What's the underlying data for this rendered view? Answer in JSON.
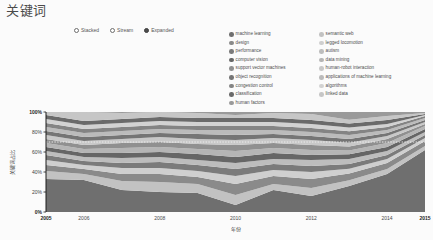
{
  "header": {
    "title": "关键词"
  },
  "layout_mode": {
    "name": "layout-mode",
    "selected": "Expanded",
    "options": [
      {
        "label": "Stacked",
        "selected": false
      },
      {
        "label": "Stream",
        "selected": false
      },
      {
        "label": "Expanded",
        "selected": true
      }
    ]
  },
  "legend": {
    "columns": 2,
    "items": [
      {
        "label": "machine learning",
        "color": "#6f6f6f"
      },
      {
        "label": "semantic web",
        "color": "#c2c2c2"
      },
      {
        "label": "design",
        "color": "#8a8a8a"
      },
      {
        "label": "legged locomotion",
        "color": "#cfcfcf"
      },
      {
        "label": "performance",
        "color": "#7b7b7b"
      },
      {
        "label": "autism",
        "color": "#bdbdbd"
      },
      {
        "label": "computer vision",
        "color": "#666666"
      },
      {
        "label": "data mining",
        "color": "#b5b5b5"
      },
      {
        "label": "support vector machines",
        "color": "#909090"
      },
      {
        "label": "human-robot interaction",
        "color": "#c8c8c8"
      },
      {
        "label": "object recognition",
        "color": "#757575"
      },
      {
        "label": "applications of machine learning",
        "color": "#bbbbbb"
      },
      {
        "label": "congestion control",
        "color": "#848484"
      },
      {
        "label": "algorithms",
        "color": "#d2d2d2"
      },
      {
        "label": "classification",
        "color": "#6a6a6a"
      },
      {
        "label": "linked data",
        "color": "#c6c6c6"
      },
      {
        "label": "human factors",
        "color": "#9a9a9a"
      }
    ]
  },
  "chart_data": {
    "type": "area",
    "title": "",
    "xlabel": "年份",
    "ylabel": "关键词占比",
    "stack_mode": "expanded",
    "grid": false,
    "legend_position": "top-right",
    "x": [
      2005,
      2006,
      2007,
      2008,
      2009,
      2010,
      2011,
      2012,
      2013,
      2014,
      2015
    ],
    "xticks": [
      "2005",
      "2006",
      "2008",
      "2010",
      "2012",
      "2014",
      "2015"
    ],
    "xtick_values": [
      2005,
      2006,
      2008,
      2010,
      2012,
      2014,
      2015
    ],
    "xlim": [
      2005,
      2015
    ],
    "yticks": [
      "0%",
      "20%",
      "40%",
      "60%",
      "80%",
      "100%"
    ],
    "ytick_values": [
      0,
      20,
      40,
      60,
      80,
      100
    ],
    "ylim": [
      0,
      100
    ],
    "series": [
      {
        "name": "machine learning",
        "color": "#6f6f6f",
        "values": [
          33,
          32,
          22,
          20,
          19,
          7,
          22,
          16,
          27,
          38,
          62
        ]
      },
      {
        "name": "semantic web",
        "color": "#c2c2c2",
        "values": [
          8,
          6,
          9,
          10,
          9,
          10,
          6,
          8,
          6,
          5,
          4
        ]
      },
      {
        "name": "design",
        "color": "#8a8a8a",
        "values": [
          6,
          5,
          7,
          8,
          7,
          11,
          8,
          9,
          7,
          6,
          5
        ]
      },
      {
        "name": "legged locomotion",
        "color": "#cfcfcf",
        "values": [
          5,
          4,
          6,
          6,
          6,
          8,
          6,
          7,
          5,
          4,
          3
        ]
      },
      {
        "name": "performance",
        "color": "#7b7b7b",
        "values": [
          5,
          4,
          5,
          6,
          6,
          7,
          6,
          6,
          5,
          4,
          3
        ]
      },
      {
        "name": "autism",
        "color": "#bdbdbd",
        "values": [
          4,
          4,
          5,
          5,
          5,
          6,
          5,
          6,
          5,
          4,
          3
        ]
      },
      {
        "name": "computer vision",
        "color": "#666666",
        "values": [
          4,
          4,
          5,
          5,
          6,
          6,
          6,
          5,
          5,
          4,
          3
        ]
      },
      {
        "name": "data mining",
        "color": "#b5b5b5",
        "values": [
          4,
          4,
          5,
          5,
          5,
          6,
          5,
          5,
          4,
          4,
          3
        ]
      },
      {
        "name": "support vector machines",
        "color": "#909090",
        "values": [
          4,
          4,
          5,
          5,
          5,
          6,
          5,
          5,
          4,
          4,
          2
        ]
      },
      {
        "name": "human-robot interaction",
        "color": "#c8c8c8",
        "values": [
          4,
          4,
          4,
          5,
          5,
          5,
          5,
          5,
          4,
          3,
          2
        ]
      },
      {
        "name": "object recognition",
        "color": "#757575",
        "values": [
          4,
          4,
          4,
          4,
          5,
          5,
          4,
          4,
          4,
          3,
          2
        ]
      },
      {
        "name": "applications of machine learning",
        "color": "#bbbbbb",
        "values": [
          4,
          4,
          4,
          4,
          4,
          5,
          4,
          4,
          4,
          3,
          2
        ]
      },
      {
        "name": "congestion control",
        "color": "#848484",
        "values": [
          4,
          4,
          4,
          4,
          4,
          4,
          4,
          4,
          4,
          3,
          2
        ]
      },
      {
        "name": "algorithms",
        "color": "#d2d2d2",
        "values": [
          4,
          4,
          4,
          4,
          4,
          4,
          4,
          4,
          4,
          3,
          1
        ]
      },
      {
        "name": "classification",
        "color": "#6a6a6a",
        "values": [
          4,
          4,
          4,
          4,
          4,
          4,
          4,
          4,
          4,
          4,
          1
        ]
      },
      {
        "name": "linked data",
        "color": "#c6c6c6",
        "values": [
          3,
          9,
          6,
          5,
          5,
          3,
          5,
          6,
          4,
          4,
          1
        ]
      },
      {
        "name": "human factors",
        "color": "#9a9a9a",
        "values": [
          0,
          0,
          1,
          0,
          1,
          3,
          1,
          2,
          8,
          4,
          1
        ]
      }
    ]
  }
}
